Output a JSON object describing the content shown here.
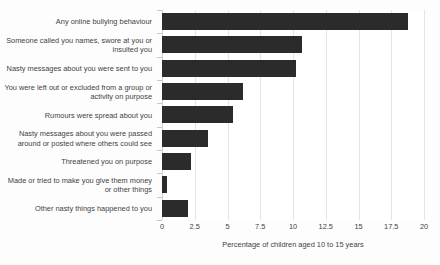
{
  "chart_data": {
    "type": "bar",
    "orientation": "horizontal",
    "title": "",
    "subtitle": "",
    "xlabel": "Percentage of children aged 10 to 15 years",
    "ylabel": "",
    "xlim": [
      0,
      20
    ],
    "ylim": null,
    "grid": true,
    "legend": null,
    "legend_position": "none",
    "xticks": [
      0,
      2.5,
      5,
      7.5,
      10,
      12.5,
      15,
      17.5,
      20
    ],
    "xticklabels": [
      "0",
      "2.5",
      "5",
      "7.5",
      "10",
      "12.5",
      "15",
      "17.5",
      "20"
    ],
    "bar_color": "#2b2b2b",
    "grid_color": "#e4e4e4",
    "background_color": "#ffffff",
    "categories": [
      "Any online bullying behaviour",
      "Someone called you names, swore at you or insulted you",
      "Nasty messages about you were sent to you",
      "You were left out or excluded from a group or activity on purpose",
      "Rumours were spread about you",
      "Nasty messages about you were passed around or posted where others could see",
      "Threatened you on purpose",
      "Made or tried to make you give them money or other things",
      "Other nasty things happened to you"
    ],
    "values": [
      18.8,
      10.7,
      10.2,
      6.2,
      5.4,
      3.5,
      2.2,
      0.4,
      2.0
    ]
  }
}
